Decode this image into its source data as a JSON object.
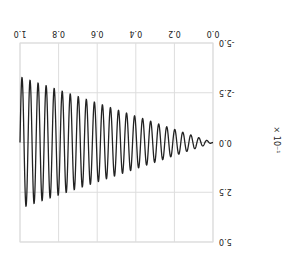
{
  "chart_data": {
    "type": "line",
    "title": "",
    "xlabel": "",
    "ylabel": "",
    "y_scale_label": "× 10⁻¹",
    "xlim": [
      0.0,
      1.0
    ],
    "ylim": [
      -5.0,
      5.0
    ],
    "x_ticks": [
      "0.0",
      "0.2",
      "0.4",
      "0.6",
      "0.8",
      "1.0"
    ],
    "y_ticks": [
      "-5.0",
      "-2.5",
      "0.0",
      "2.5",
      "5.0"
    ],
    "grid": true,
    "rotation_degrees": 180,
    "series": [
      {
        "name": "signal",
        "color": "#222222",
        "description": "sinusoid with amplitude growing linearly from ~0 at x=0 to ~3.3 at x=1.0, about 24 cycles",
        "amplitude_start": 0.0,
        "amplitude_end": 3.3,
        "cycles": 24
      }
    ]
  },
  "colors": {
    "grid": "#dddddd",
    "line": "#222222",
    "axis_text": "#222222"
  }
}
